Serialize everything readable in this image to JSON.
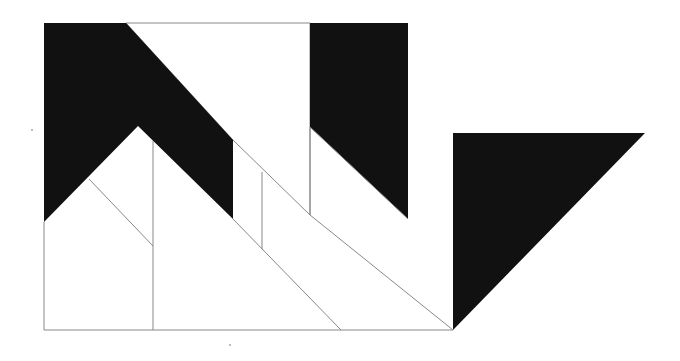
{
  "diagram": {
    "colors": {
      "background": "#ffffff",
      "fill_dark": "#111111",
      "stroke": "#888888"
    },
    "filled_polygons": [
      {
        "name": "left-chevron-black",
        "points": "44,23 126,23 233,140 233,219 138,126 44,222"
      },
      {
        "name": "right-block-black",
        "points": "310,23 408,23 408,219 310,127"
      },
      {
        "name": "right-triangle-black",
        "points": "453,133 645,133 453,330"
      }
    ],
    "outline_polygons": [
      {
        "name": "top-white-region",
        "points": "126,23 310,23 310,215 233,140"
      }
    ],
    "lines": [
      {
        "name": "left-edge",
        "x1": 44,
        "y1": 222,
        "x2": 44,
        "y2": 330
      },
      {
        "name": "bottom-edge",
        "x1": 44,
        "y1": 330,
        "x2": 453,
        "y2": 330
      },
      {
        "name": "inner-diagonal-left",
        "x1": 89,
        "y1": 179,
        "x2": 153,
        "y2": 246
      },
      {
        "name": "vertical-153",
        "x1": 153,
        "y1": 141,
        "x2": 153,
        "y2": 330
      },
      {
        "name": "diagonal-to-341",
        "x1": 233,
        "y1": 219,
        "x2": 341,
        "y2": 330
      },
      {
        "name": "vertical-262",
        "x1": 262,
        "y1": 172,
        "x2": 262,
        "y2": 249
      },
      {
        "name": "vertical-310-lower",
        "x1": 310,
        "y1": 127,
        "x2": 310,
        "y2": 215
      },
      {
        "name": "diagonal-to-453",
        "x1": 310,
        "y1": 215,
        "x2": 453,
        "y2": 330
      },
      {
        "name": "diagonal-from-310",
        "x1": 310,
        "y1": 127,
        "x2": 408,
        "y2": 219
      }
    ],
    "specks": [
      {
        "name": "speck-left",
        "cx": 32,
        "cy": 130
      },
      {
        "name": "speck-bottom",
        "cx": 230,
        "cy": 345
      }
    ]
  }
}
